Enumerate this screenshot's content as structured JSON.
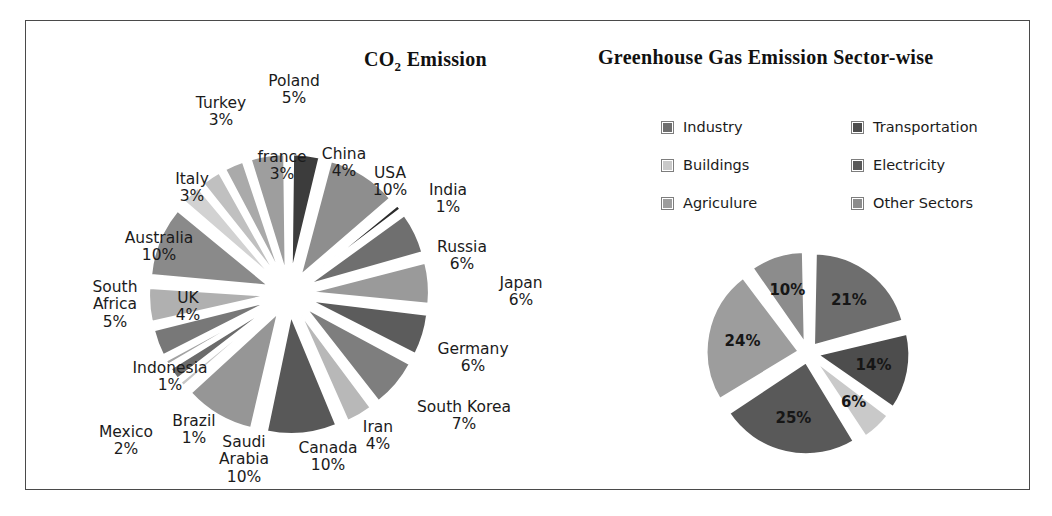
{
  "frame": {
    "border_color": "#4a4a4a"
  },
  "left_chart": {
    "title_main": "CO",
    "title_sub": "2",
    "title_tail": " Emission"
  },
  "right_chart": {
    "title": "Greenhouse Gas Emission  Sector-wise"
  },
  "chart_data": [
    {
      "type": "pie",
      "id": "co2-emission",
      "title": "CO2 Emission",
      "exploded": true,
      "start_angle_deg": 0,
      "labels_show_percent": true,
      "categories": [
        "China",
        "USA",
        "India",
        "Russia",
        "Japan",
        "Germany",
        "South Korea",
        "Iran",
        "Canada",
        "Saudi Arabia",
        "Brazil",
        "Mexico",
        "Indonesia",
        "UK",
        "South Africa",
        "Australia",
        "Italy",
        "Turkey",
        "france",
        "Poland"
      ],
      "values": [
        4,
        10,
        1,
        6,
        6,
        6,
        7,
        4,
        10,
        10,
        1,
        2,
        1,
        4,
        5,
        10,
        3,
        3,
        3,
        5
      ],
      "colors": [
        "#3c3c3c",
        "#8e8e8e",
        "#2b2b2b",
        "#6f6f6f",
        "#9a9a9a",
        "#5c5c5c",
        "#7e7e7e",
        "#b8b8b8",
        "#585858",
        "#969696",
        "#c6c6c6",
        "#6b6b6b",
        "#a2a2a2",
        "#787878",
        "#b0b0b0",
        "#8a8a8a",
        "#d2d2d2",
        "#c0c0c0",
        "#aaaaaa",
        "#9e9e9e"
      ],
      "labels": [
        {
          "name": "China",
          "pct": "4%"
        },
        {
          "name": "USA",
          "pct": "10%"
        },
        {
          "name": "India",
          "pct": "1%"
        },
        {
          "name": "Russia",
          "pct": "6%"
        },
        {
          "name": "Japan",
          "pct": "6%"
        },
        {
          "name": "Germany",
          "pct": "6%"
        },
        {
          "name": "South Korea",
          "pct": "7%"
        },
        {
          "name": "Iran",
          "pct": "4%"
        },
        {
          "name": "Canada",
          "pct": "10%"
        },
        {
          "name": "Saudi Arabia",
          "pct": "10%"
        },
        {
          "name": "Brazil",
          "pct": "1%"
        },
        {
          "name": "Mexico",
          "pct": "2%"
        },
        {
          "name": "Indonesia",
          "pct": "1%"
        },
        {
          "name": "UK",
          "pct": "4%"
        },
        {
          "name": "South Africa",
          "pct": "5%"
        },
        {
          "name": "Australia",
          "pct": "10%"
        },
        {
          "name": "Italy",
          "pct": "3%"
        },
        {
          "name": "Turkey",
          "pct": "3%"
        },
        {
          "name": "france",
          "pct": "3%"
        },
        {
          "name": "Poland",
          "pct": "5%"
        }
      ]
    },
    {
      "type": "pie",
      "id": "ghg-sector-wise",
      "title": "Greenhouse Gas Emission Sector-wise",
      "exploded": true,
      "legend_position": "top",
      "categories": [
        "Industry",
        "Transportation",
        "Buildings",
        "Electricity",
        "Agriculure",
        "Other Sectors"
      ],
      "values": [
        21,
        14,
        6,
        25,
        24,
        10
      ],
      "value_labels": [
        "21%",
        "14%",
        "6%",
        "25%",
        "24%",
        "10%"
      ],
      "colors": [
        "#6e6e6e",
        "#4d4d4d",
        "#c9c9c9",
        "#595959",
        "#9d9d9d",
        "#8c8c8c"
      ]
    }
  ],
  "left_labels_positions": [
    {
      "key": "poland",
      "text": "Poland\n5%",
      "x": 197,
      "y": 22,
      "w": 86
    },
    {
      "key": "turkey",
      "text": "Turkey\n3%",
      "x": 124,
      "y": 44,
      "w": 86
    },
    {
      "key": "france",
      "text": "france\n3%",
      "x": 188,
      "y": 98,
      "w": 80
    },
    {
      "key": "china",
      "text": "China\n4%",
      "x": 254,
      "y": 95,
      "w": 72
    },
    {
      "key": "italy",
      "text": "Italy\n3%",
      "x": 103,
      "y": 120,
      "w": 70
    },
    {
      "key": "usa",
      "text": "USA\n10%",
      "x": 305,
      "y": 114,
      "w": 62
    },
    {
      "key": "india",
      "text": "India\n1%",
      "x": 363,
      "y": 131,
      "w": 62
    },
    {
      "key": "australia",
      "text": "Australia\n10%",
      "x": 53,
      "y": 179,
      "w": 104
    },
    {
      "key": "russia",
      "text": "Russia\n6%",
      "x": 369,
      "y": 188,
      "w": 78
    },
    {
      "key": "japan",
      "text": "Japan\n6%",
      "x": 432,
      "y": 224,
      "w": 70
    },
    {
      "key": "south-africa",
      "text": "South\nAfrica\n5%",
      "x": 24,
      "y": 228,
      "w": 74
    },
    {
      "key": "uk",
      "text": "UK\n4%",
      "x": 108,
      "y": 239,
      "w": 52
    },
    {
      "key": "germany",
      "text": "Germany\n6%",
      "x": 370,
      "y": 290,
      "w": 98
    },
    {
      "key": "indonesia",
      "text": "Indonesia\n1%",
      "x": 63,
      "y": 309,
      "w": 106
    },
    {
      "key": "south-korea",
      "text": "South Korea\n7%",
      "x": 348,
      "y": 348,
      "w": 124
    },
    {
      "key": "mexico",
      "text": "Mexico\n2%",
      "x": 32,
      "y": 373,
      "w": 80
    },
    {
      "key": "brazil",
      "text": "Brazil\n1%",
      "x": 107,
      "y": 362,
      "w": 66
    },
    {
      "key": "iran",
      "text": "Iran\n4%",
      "x": 297,
      "y": 368,
      "w": 54
    },
    {
      "key": "saudi-arabia",
      "text": "Saudi\nArabia\n10%",
      "x": 150,
      "y": 383,
      "w": 80
    },
    {
      "key": "canada",
      "text": "Canada\n10%",
      "x": 228,
      "y": 389,
      "w": 92
    }
  ]
}
